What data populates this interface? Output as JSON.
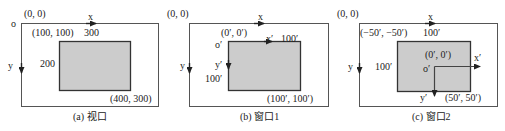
{
  "colors": {
    "frame": "#555555",
    "region_fill": "#cccccc",
    "region_border": "#333333",
    "text": "#222222"
  },
  "panels": [
    {
      "id": "a",
      "caption": "(a) 视口",
      "origin_letter": "o",
      "origin_coord": "(0, 0)",
      "x_axis": "x",
      "y_axis": "y",
      "top_left": "(100, 100)",
      "width_label": "300",
      "height_label": "200",
      "bottom_right": "(400, 300)"
    },
    {
      "id": "b",
      "caption": "(b) 窗口1",
      "origin_coord": "(0, 0)",
      "x_axis": "x",
      "y_axis": "y",
      "inner_origin_coord": "(0′, 0′)",
      "inner_origin_letter": "o′",
      "inner_x_axis": "x′",
      "width_label": "100′",
      "inner_y_axis": "y′",
      "height_label": "100′",
      "bottom_right": "(100′, 100′)"
    },
    {
      "id": "c",
      "caption": "(c) 窗口2",
      "origin_coord": "(0, 0)",
      "x_axis": "x",
      "y_axis": "y",
      "top_left": "(−50′, −50′)",
      "width_label": "100′",
      "height_label": "100′",
      "inner_origin_coord": "(0′, 0′)",
      "inner_origin_letter": "o′",
      "inner_x_axis": "x′",
      "inner_y_axis": "y′",
      "bottom_right": "(50′, 50′)"
    }
  ]
}
